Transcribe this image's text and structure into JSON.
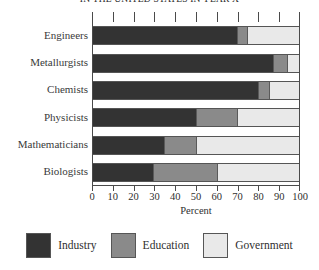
{
  "chart_data": {
    "type": "bar",
    "orientation": "horizontal",
    "stacked": true,
    "normalized": true,
    "title": "IN THE UNITED STATES IN YEAR X",
    "xlabel": "Percent",
    "ylabel": "",
    "xlim": [
      0,
      100
    ],
    "xticks": [
      0,
      10,
      20,
      30,
      40,
      50,
      60,
      70,
      80,
      90,
      100
    ],
    "xtick_labels": [
      "0",
      "10",
      "20",
      "30",
      "40",
      "50",
      "60",
      "70",
      "80",
      "90",
      "100"
    ],
    "grid": false,
    "legend_position": "bottom",
    "categories": [
      "Engineers",
      "Metallurgists",
      "Chemists",
      "Physicists",
      "Mathematicians",
      "Biologists"
    ],
    "series": [
      {
        "name": "Industry",
        "color": "#333333",
        "values": [
          70.0,
          87.5,
          80.0,
          50.0,
          34.5,
          29.0
        ]
      },
      {
        "name": "Education",
        "color": "#8a8a8a",
        "values": [
          5.0,
          6.5,
          5.5,
          20.0,
          15.5,
          31.0
        ]
      },
      {
        "name": "Government",
        "color": "#e9e9e9",
        "values": [
          25.0,
          6.0,
          14.5,
          30.0,
          50.0,
          40.0
        ]
      }
    ]
  },
  "legend": {
    "items": [
      {
        "label": "Industry"
      },
      {
        "label": "Education"
      },
      {
        "label": "Government"
      }
    ]
  }
}
